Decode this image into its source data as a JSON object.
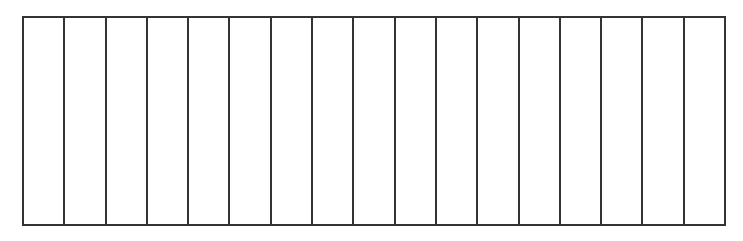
{
  "diagram": {
    "type": "rectangle-divided-into-equal-vertical-strips",
    "columns": 17,
    "rows": 1,
    "shaded_columns": [],
    "line_color": "#333333",
    "fill_color": "#ffffff"
  }
}
